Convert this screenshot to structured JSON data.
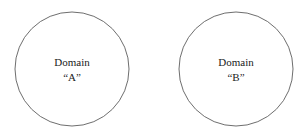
{
  "diagram": {
    "nodes": [
      {
        "id": "A",
        "line1": "Domain",
        "line2": "“A”"
      },
      {
        "id": "B",
        "line1": "Domain",
        "line2": "“B”"
      }
    ],
    "stroke_color": "#6e6e6e",
    "text_color": "#222222"
  }
}
